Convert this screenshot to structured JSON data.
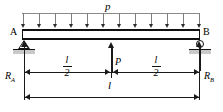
{
  "diagram": {
    "type": "structural-beam-load-diagram",
    "colors": {
      "line": "#111111",
      "load_arrow": "#2b2b2b",
      "ground_hatch": "#c9c9c9",
      "background": "#ffffff"
    },
    "labels": {
      "distributed_load": "p",
      "node_left": "A",
      "node_right": "B",
      "point_load": "P",
      "reaction_left_symbol": "R",
      "reaction_left_sub": "A",
      "reaction_right_symbol": "R",
      "reaction_right_sub": "B",
      "span_total": "l",
      "half_span_numerator": "l",
      "half_span_denominator": "2"
    },
    "supports": {
      "left": {
        "kind": "pin-support",
        "icon": "triangle-pin-icon"
      },
      "right": {
        "kind": "roller-support",
        "icon": "circle-roller-icon"
      }
    },
    "loads": {
      "distributed": {
        "symbol": "p",
        "direction": "down",
        "arrow_count": 12
      },
      "concentrated": {
        "symbol": "P",
        "direction": "up",
        "position": "midspan"
      }
    },
    "dimensions": [
      {
        "name": "left-half",
        "value": "l/2"
      },
      {
        "name": "right-half",
        "value": "l/2"
      },
      {
        "name": "total-span",
        "value": "l"
      }
    ]
  }
}
